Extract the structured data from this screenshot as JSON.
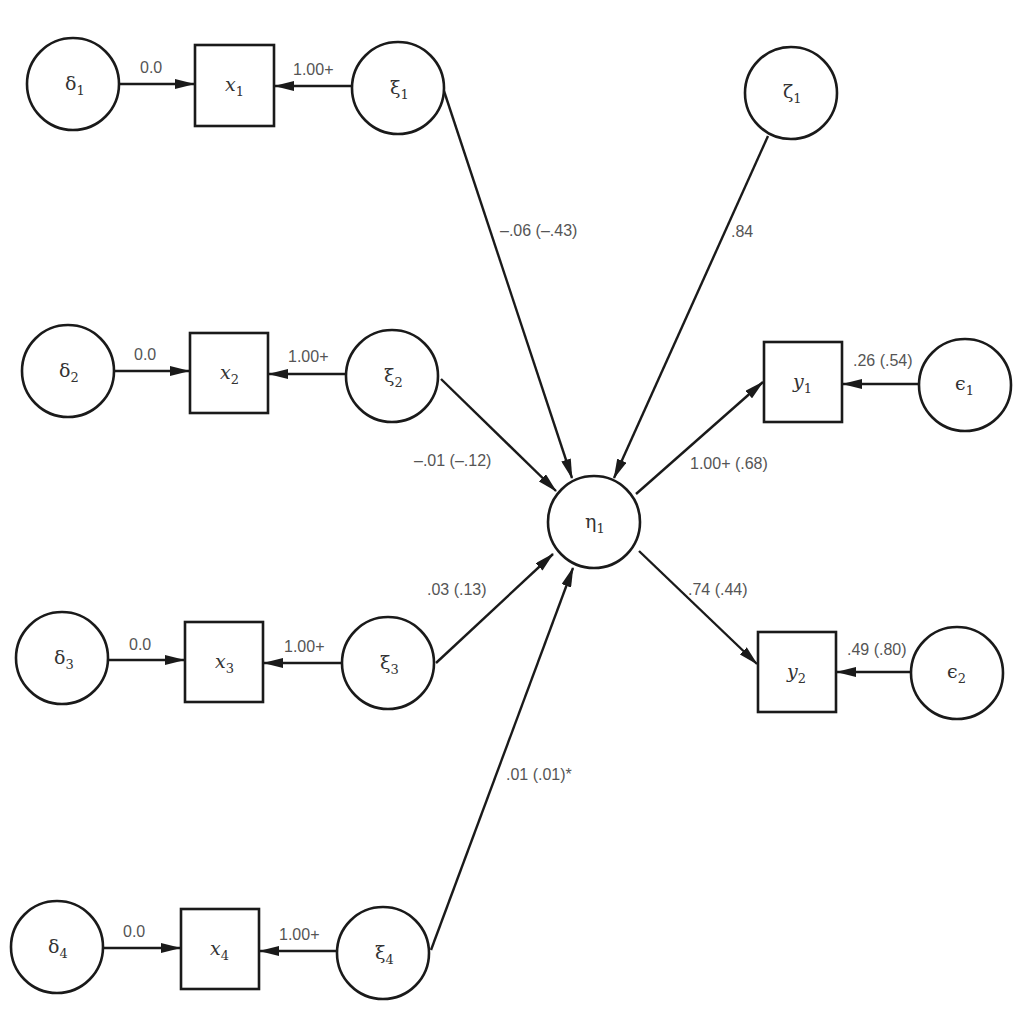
{
  "diagram": {
    "type": "structural-equation-model path diagram",
    "nodes": {
      "delta1": {
        "symbol": "δ",
        "sub": "1",
        "kind": "error-latent"
      },
      "delta2": {
        "symbol": "δ",
        "sub": "2",
        "kind": "error-latent"
      },
      "delta3": {
        "symbol": "δ",
        "sub": "3",
        "kind": "error-latent"
      },
      "delta4": {
        "symbol": "δ",
        "sub": "4",
        "kind": "error-latent"
      },
      "x1": {
        "symbol": "x",
        "sub": "1",
        "kind": "observed"
      },
      "x2": {
        "symbol": "x",
        "sub": "2",
        "kind": "observed"
      },
      "x3": {
        "symbol": "x",
        "sub": "3",
        "kind": "observed"
      },
      "x4": {
        "symbol": "x",
        "sub": "4",
        "kind": "observed"
      },
      "xi1": {
        "symbol": "ξ",
        "sub": "1",
        "kind": "latent"
      },
      "xi2": {
        "symbol": "ξ",
        "sub": "2",
        "kind": "latent"
      },
      "xi3": {
        "symbol": "ξ",
        "sub": "3",
        "kind": "latent"
      },
      "xi4": {
        "symbol": "ξ",
        "sub": "4",
        "kind": "latent"
      },
      "eta1": {
        "symbol": "η",
        "sub": "1",
        "kind": "latent"
      },
      "zeta1": {
        "symbol": "ζ",
        "sub": "1",
        "kind": "disturbance"
      },
      "y1": {
        "symbol": "y",
        "sub": "1",
        "kind": "observed"
      },
      "y2": {
        "symbol": "y",
        "sub": "2",
        "kind": "observed"
      },
      "eps1": {
        "symbol": "ϵ",
        "sub": "1",
        "kind": "error-latent"
      },
      "eps2": {
        "symbol": "ϵ",
        "sub": "2",
        "kind": "error-latent"
      }
    },
    "edges": {
      "delta1_x1": {
        "from": "δ1",
        "to": "x1",
        "label": "0.0"
      },
      "xi1_x1": {
        "from": "ξ1",
        "to": "x1",
        "label": "1.00+"
      },
      "delta2_x2": {
        "from": "δ2",
        "to": "x2",
        "label": "0.0"
      },
      "xi2_x2": {
        "from": "ξ2",
        "to": "x2",
        "label": "1.00+"
      },
      "delta3_x3": {
        "from": "δ3",
        "to": "x3",
        "label": "0.0"
      },
      "xi3_x3": {
        "from": "ξ3",
        "to": "x3",
        "label": "1.00+"
      },
      "delta4_x4": {
        "from": "δ4",
        "to": "x4",
        "label": "0.0"
      },
      "xi4_x4": {
        "from": "ξ4",
        "to": "x4",
        "label": "1.00+"
      },
      "xi1_eta1": {
        "from": "ξ1",
        "to": "η1",
        "label": "–.06 (–.43)"
      },
      "xi2_eta1": {
        "from": "ξ2",
        "to": "η1",
        "label": "–.01 (–.12)"
      },
      "xi3_eta1": {
        "from": "ξ3",
        "to": "η1",
        "label": ".03 (.13)"
      },
      "xi4_eta1": {
        "from": "ξ4",
        "to": "η1",
        "label": ".01 (.01)*"
      },
      "zeta1_eta1": {
        "from": "ζ1",
        "to": "η1",
        "label": ".84"
      },
      "eta1_y1": {
        "from": "η1",
        "to": "y1",
        "label": "1.00+ (.68)"
      },
      "eta1_y2": {
        "from": "η1",
        "to": "y2",
        "label": ".74 (.44)"
      },
      "eps1_y1": {
        "from": "ϵ1",
        "to": "y1",
        "label": ".26 (.54)"
      },
      "eps2_y2": {
        "from": "ϵ2",
        "to": "y2",
        "label": ".49 (.80)"
      }
    }
  },
  "colors": {
    "stroke": "#1a1a1a",
    "node_text": "#333333",
    "edge_label_text": "#555555",
    "background": "#ffffff"
  }
}
